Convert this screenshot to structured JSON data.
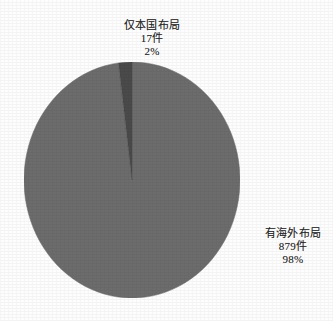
{
  "chart_data": {
    "type": "pie",
    "title": "",
    "subtitle": "",
    "xlabel": "",
    "ylabel": "",
    "legend_position": "none",
    "grid": false,
    "unit_suffix": "件",
    "total_count": 896,
    "slices": [
      {
        "name": "仅本国布局",
        "count": 17,
        "count_label": "17件",
        "percent": 2,
        "percent_label": "2%",
        "color": "#4a4a4a",
        "start_angle_deg": 352.2,
        "sweep_deg": 7.8,
        "label_position": "top"
      },
      {
        "name": "有海外布局",
        "count": 879,
        "count_label": "879件",
        "percent": 98,
        "percent_label": "98%",
        "color": "#6c6c6c",
        "start_angle_deg": 0,
        "sweep_deg": 352.2,
        "label_position": "right"
      }
    ]
  },
  "figure": {
    "background_color": "#fdfdfd",
    "outline_color": "#5a5a5a"
  }
}
